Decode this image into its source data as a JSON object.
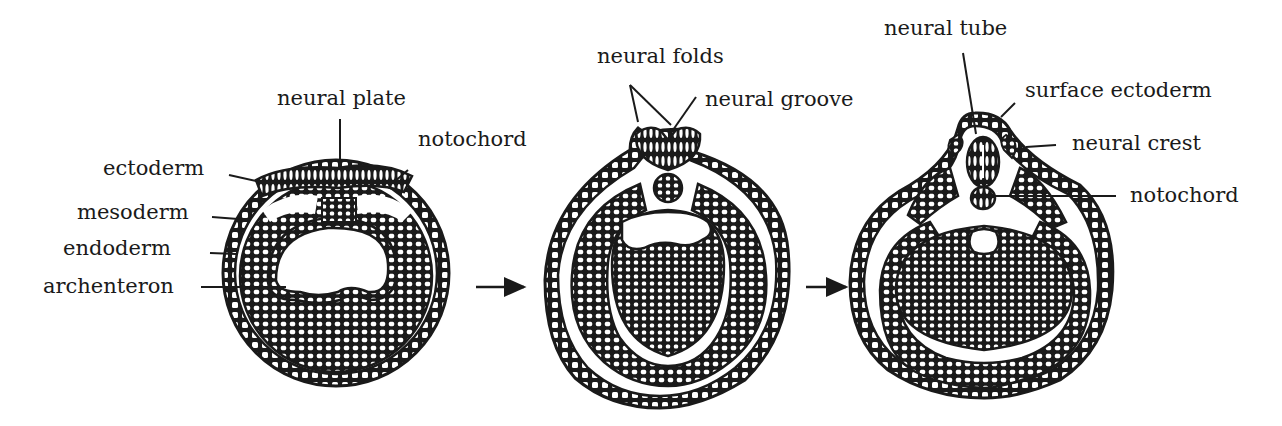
{
  "diagram": {
    "stages": [
      {
        "name": "neural-plate-stage",
        "labels": [
          {
            "key": "ectoderm",
            "text": "ectoderm"
          },
          {
            "key": "mesoderm",
            "text": "mesoderm"
          },
          {
            "key": "endoderm",
            "text": "endoderm"
          },
          {
            "key": "archenteron",
            "text": "archenteron"
          },
          {
            "key": "neural_plate",
            "text": "neural plate"
          },
          {
            "key": "notochord",
            "text": "notochord"
          }
        ]
      },
      {
        "name": "neural-groove-stage",
        "labels": [
          {
            "key": "neural_folds",
            "text": "neural folds"
          },
          {
            "key": "neural_groove",
            "text": "neural groove"
          }
        ]
      },
      {
        "name": "neural-tube-stage",
        "labels": [
          {
            "key": "neural_tube",
            "text": "neural tube"
          },
          {
            "key": "surface_ectoderm",
            "text": "surface ectoderm"
          },
          {
            "key": "neural_crest",
            "text": "neural crest"
          },
          {
            "key": "notochord",
            "text": "notochord"
          }
        ]
      }
    ],
    "arrows": [
      "stage-1-to-2",
      "stage-2-to-3"
    ],
    "colors": {
      "ink": "#1a1a1a",
      "background": "#ffffff"
    }
  }
}
